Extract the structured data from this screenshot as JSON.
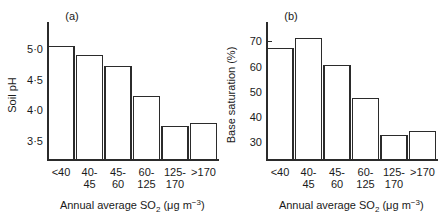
{
  "figure": {
    "width": 438,
    "height": 224,
    "background": "#ffffff",
    "ink_color": "#2b2b2b"
  },
  "chart_data": [
    {
      "type": "bar",
      "panel_tag": "(a)",
      "title": "",
      "xlabel_parts": {
        "lead": "Annual average SO",
        "sub": "2",
        "mid": " (",
        "mu": "μ",
        "unit": "g m",
        "sup": "−3",
        "tail": ")"
      },
      "xlabel": "Annual average SO2 (μg m−3)",
      "ylabel": "Soil pH",
      "categories": [
        "<40",
        "40-45",
        "45-60",
        "60-125",
        "125-170",
        ">170"
      ],
      "category_lines": [
        [
          "<40",
          ""
        ],
        [
          "40-",
          "45"
        ],
        [
          "45-",
          "60"
        ],
        [
          "60-",
          "125"
        ],
        [
          "125-",
          "170"
        ],
        [
          ">170",
          ""
        ]
      ],
      "values": [
        5.05,
        4.9,
        4.72,
        4.23,
        3.73,
        3.78
      ],
      "ytick_labels": [
        "5·0",
        "4·5",
        "4·0",
        "3·5"
      ],
      "ytick_values": [
        5.0,
        4.5,
        4.0,
        3.5
      ],
      "ylim": [
        3.18,
        5.32
      ],
      "grid": false,
      "legend": "none"
    },
    {
      "type": "bar",
      "panel_tag": "(b)",
      "title": "",
      "xlabel_parts": {
        "lead": "Annual average SO",
        "sub": "2",
        "mid": " (",
        "mu": "μ",
        "unit": "g m",
        "sup": "−3",
        "tail": ")"
      },
      "xlabel": "Annual average SO2 (μg m−3)",
      "ylabel": "Base saturation (%)",
      "categories": [
        "<40",
        "40-45",
        "45-60",
        "60-125",
        "125-170",
        ">170"
      ],
      "category_lines": [
        [
          "<40",
          ""
        ],
        [
          "40-",
          "45"
        ],
        [
          "45-",
          "60"
        ],
        [
          "60-",
          "125"
        ],
        [
          "125-",
          "170"
        ],
        [
          ">170",
          ""
        ]
      ],
      "values": [
        67.0,
        71.0,
        60.3,
        47.5,
        32.8,
        34.2
      ],
      "ytick_labels": [
        "70",
        "60",
        "50",
        "40",
        "30"
      ],
      "ytick_values": [
        70,
        60,
        50,
        40,
        30
      ],
      "ylim": [
        23.0,
        74.5
      ],
      "grid": false,
      "legend": "none"
    }
  ]
}
